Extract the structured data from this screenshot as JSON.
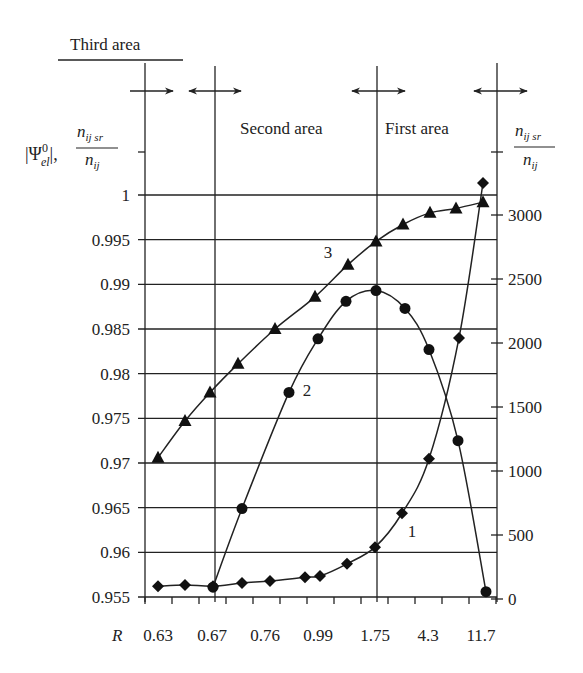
{
  "chart_data": {
    "type": "line",
    "title": "",
    "regions": [
      {
        "label": "Third area",
        "x_range": [
          "0.63",
          "0.67"
        ]
      },
      {
        "label": "Second area",
        "x_range": [
          "0.67",
          "1.75"
        ]
      },
      {
        "label": "First area",
        "x_range": [
          "1.75",
          "11.7"
        ]
      }
    ],
    "xlabel": "R",
    "x_tick_labels": [
      "0.63",
      "0.67",
      "0.76",
      "0.99",
      "1.75",
      "4.3",
      "11.7"
    ],
    "ylabel_left": "|Ψ⁰el|, n_ij sr / n_ij",
    "ylabel_right": "n_ij sr / n_ij",
    "ylim_left": [
      0.955,
      1.0
    ],
    "y_ticks_left": [
      "0.955",
      "0.96",
      "0.965",
      "0.97",
      "0.975",
      "0.98",
      "0.985",
      "0.99",
      "0.995",
      "1"
    ],
    "ylim_right": [
      0,
      3000
    ],
    "y_ticks_right": [
      "0",
      "500",
      "1000",
      "1500",
      "2000",
      "2500",
      "3000"
    ],
    "grid": true,
    "series": [
      {
        "name": "1",
        "marker": "diamond",
        "axis": "right",
        "x_px": [
          158,
          185,
          213,
          242,
          270,
          305,
          320,
          347,
          375,
          402,
          429,
          459,
          483
        ],
        "values": [
          100,
          110,
          100,
          125,
          140,
          170,
          180,
          275,
          405,
          670,
          1095,
          2040,
          3250
        ]
      },
      {
        "name": "2",
        "marker": "circle",
        "axis": "left",
        "x_px": [
          213,
          242,
          289,
          318,
          346,
          376,
          405,
          429,
          458,
          486
        ],
        "values": [
          0.9561,
          0.9649,
          0.9779,
          0.9839,
          0.9881,
          0.9893,
          0.9873,
          0.9827,
          0.9725,
          0.9556
        ]
      },
      {
        "name": "3",
        "marker": "triangle",
        "axis": "left",
        "x_px": [
          158,
          185,
          210,
          238,
          275,
          315,
          348,
          376,
          403,
          430,
          456,
          483
        ],
        "values": [
          0.9706,
          0.9747,
          0.9779,
          0.9811,
          0.985,
          0.9886,
          0.9922,
          0.9948,
          0.9967,
          0.998,
          0.9985,
          0.9992
        ]
      }
    ],
    "curve_labels": [
      {
        "text": "1",
        "x": 412,
        "y": 537
      },
      {
        "text": "2",
        "x": 307,
        "y": 396
      },
      {
        "text": "3",
        "x": 328,
        "y": 258
      }
    ]
  },
  "labels": {
    "third_area": "Third area",
    "second_area": "Second area",
    "first_area": "First area",
    "x_axis_var": "R",
    "left_axis_psi": "|Ψ",
    "left_axis_sup": "0",
    "left_axis_sub": "el",
    "frac_num": "n",
    "frac_num_sub": "ij sr",
    "frac_den": "n",
    "frac_den_sub": "ij"
  }
}
